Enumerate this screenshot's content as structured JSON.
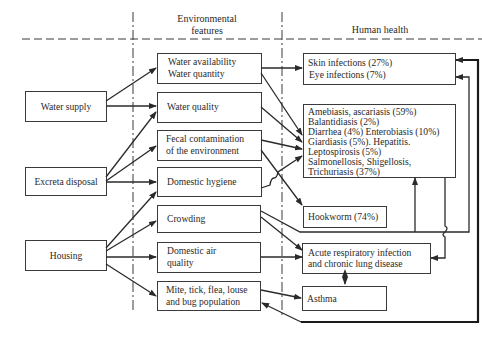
{
  "headers": {
    "environmental": [
      "Environmental",
      "features"
    ],
    "health": "Human health"
  },
  "sources": [
    {
      "id": "water-supply",
      "label": "Water supply"
    },
    {
      "id": "excreta-disposal",
      "label": "Excreta disposal"
    },
    {
      "id": "housing",
      "label": "Housing"
    }
  ],
  "features": [
    {
      "id": "water-availability",
      "lines": [
        "Water availability",
        "Water quantity"
      ]
    },
    {
      "id": "water-quality",
      "lines": [
        "Water quality"
      ]
    },
    {
      "id": "fecal-contamination",
      "lines": [
        "Fecal contamination",
        "of the environment"
      ]
    },
    {
      "id": "domestic-hygiene",
      "lines": [
        "Domestic hygiene"
      ]
    },
    {
      "id": "crowding",
      "lines": [
        "Crowding"
      ]
    },
    {
      "id": "domestic-air-quality",
      "lines": [
        "Domestic air",
        "quality"
      ]
    },
    {
      "id": "vector-population",
      "lines": [
        "Mite, tick, flea, louse",
        "and bug population"
      ]
    }
  ],
  "outcomes": [
    {
      "id": "skin-eye",
      "lines": [
        "Skin infections (27%)",
        "Eye infections (7%)"
      ]
    },
    {
      "id": "enteric",
      "lines": [
        "Amebiasis, ascariasis (59%)",
        "Balantidiasis (2%)",
        "Diarrhea (4%)  Enterobiasis (10%)",
        "Giardiasis (5%). Hepatitis.",
        "Leptospirosis (5%)",
        "Salmonellosis, Shigellosis,",
        "Trichuriasis (37%)"
      ]
    },
    {
      "id": "hookworm",
      "lines": [
        "Hookworm (74%)"
      ]
    },
    {
      "id": "respiratory",
      "lines": [
        "Acute respiratory infection",
        "and chronic lung disease"
      ]
    },
    {
      "id": "asthma",
      "lines": [
        "Asthma"
      ]
    }
  ]
}
